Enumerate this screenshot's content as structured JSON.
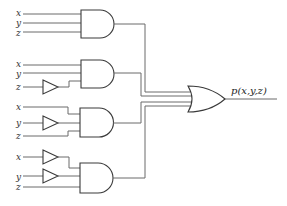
{
  "diagram": {
    "type": "logic-circuit",
    "output_label": "p(x,y,z)",
    "gates": [
      {
        "type": "AND",
        "inputs": [
          {
            "label": "x",
            "inverted": false
          },
          {
            "label": "y",
            "inverted": false
          },
          {
            "label": "z",
            "inverted": false
          }
        ]
      },
      {
        "type": "AND",
        "inputs": [
          {
            "label": "x",
            "inverted": false
          },
          {
            "label": "y",
            "inverted": false
          },
          {
            "label": "z",
            "inverted": true
          }
        ]
      },
      {
        "type": "AND",
        "inputs": [
          {
            "label": "x",
            "inverted": false
          },
          {
            "label": "y",
            "inverted": true
          },
          {
            "label": "z",
            "inverted": false
          }
        ]
      },
      {
        "type": "AND",
        "inputs": [
          {
            "label": "x",
            "inverted": true
          },
          {
            "label": "y",
            "inverted": true
          },
          {
            "label": "z",
            "inverted": false
          }
        ]
      }
    ],
    "final_gate": "OR",
    "labels": {
      "g1": {
        "x": "x",
        "y": "y",
        "z": "z"
      },
      "g2": {
        "x": "x",
        "y": "y",
        "z": "z"
      },
      "g3": {
        "x": "x",
        "y": "y",
        "z": "z"
      },
      "g4": {
        "x": "x",
        "y": "y",
        "z": "z"
      }
    }
  }
}
